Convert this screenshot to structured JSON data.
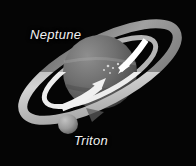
{
  "diagram": {
    "background_color": "#050505",
    "labels": {
      "planet": "Neptune",
      "moon": "Triton"
    },
    "bodies": [
      {
        "name": "Neptune",
        "kind": "planet",
        "cx": 100,
        "cy": 72,
        "r": 37,
        "fill": "#6a6a6a",
        "highlight": "#8e8e8e",
        "shadow": "#3a3a3a"
      },
      {
        "name": "Triton",
        "kind": "moon",
        "cx": 68,
        "cy": 124,
        "r": 10,
        "fill": "#9a9a9a",
        "highlight": "#c2c2c2",
        "shadow": "#5c5c5c"
      }
    ],
    "rings": [
      {
        "name": "outer-ring",
        "color": "#8f8f8f",
        "width": 9,
        "tilt_deg": -28
      },
      {
        "name": "inner-ring",
        "color": "#b4b4b4",
        "width": 6,
        "tilt_deg": -28
      }
    ],
    "arrows": [
      {
        "name": "rotation-arrow",
        "color": "#f0f0f0",
        "direction": "up-right",
        "describes": "spin / orbital motion"
      },
      {
        "name": "orbit-arrow",
        "color": "#ffffff",
        "direction": "up-right",
        "describes": "Triton retrograde orbit path"
      }
    ]
  }
}
